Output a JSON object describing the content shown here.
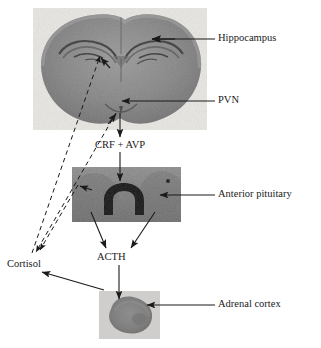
{
  "figure": {
    "labels": {
      "hippocampus": "Hippocampus",
      "pvn": "PVN",
      "crf_avp": "CRF + AVP",
      "anterior_pituitary": "Anterior pituitary",
      "acth": "ACTH",
      "cortisol": "Cortisol",
      "adrenal_cortex": "Adrenal cortex"
    },
    "images": [
      {
        "name": "brain-coronal-section",
        "depicts": "rat brain coronal section"
      },
      {
        "name": "pituitary-section",
        "depicts": "anterior pituitary tissue section"
      },
      {
        "name": "adrenal-section",
        "depicts": "adrenal gland tissue section"
      }
    ],
    "connectors": [
      {
        "name": "leader-hippocampus",
        "style": "solid-arrow",
        "from": "Hippocampus label",
        "to": "hippocampus region"
      },
      {
        "name": "leader-pvn",
        "style": "solid-arrow",
        "from": "PVN label",
        "to": "PVN region"
      },
      {
        "name": "arrow-pvn-to-crf",
        "style": "solid-arrow",
        "from": "PVN",
        "to": "CRF + AVP"
      },
      {
        "name": "arrow-crf-to-pituitary",
        "style": "solid-arrow",
        "from": "CRF + AVP",
        "to": "Anterior pituitary"
      },
      {
        "name": "leader-anterior-pituitary",
        "style": "solid-arrow",
        "from": "Anterior pituitary label",
        "to": "pituitary section"
      },
      {
        "name": "arrow-pituitary-to-acth-left",
        "style": "solid-arrow",
        "from": "Anterior pituitary",
        "to": "ACTH"
      },
      {
        "name": "arrow-pituitary-to-acth-right",
        "style": "solid-arrow",
        "from": "Anterior pituitary",
        "to": "ACTH"
      },
      {
        "name": "arrow-acth-to-adrenal",
        "style": "solid-arrow",
        "from": "ACTH",
        "to": "Adrenal cortex"
      },
      {
        "name": "leader-adrenal-cortex",
        "style": "solid-arrow",
        "from": "Adrenal cortex label",
        "to": "adrenal section"
      },
      {
        "name": "arrow-adrenal-to-cortisol",
        "style": "solid-arrow",
        "from": "Adrenal cortex",
        "to": "Cortisol"
      },
      {
        "name": "feedback-cortisol-to-hippocampus",
        "style": "dashed-arrow",
        "from": "Cortisol",
        "to": "hippocampus"
      },
      {
        "name": "feedback-cortisol-to-pvn",
        "style": "dashed-arrow",
        "from": "Cortisol",
        "to": "PVN"
      },
      {
        "name": "feedback-cortisol-to-pituitary",
        "style": "dashed-arrow",
        "from": "Cortisol",
        "to": "anterior pituitary"
      }
    ],
    "colors": {
      "line": "#1a1a1a",
      "text": "#1a1a1a",
      "background": "#ffffff",
      "tissue_dark": "#5e5e5e",
      "tissue_mid": "#8a8a8a",
      "tissue_light": "#c9c9c9"
    }
  }
}
